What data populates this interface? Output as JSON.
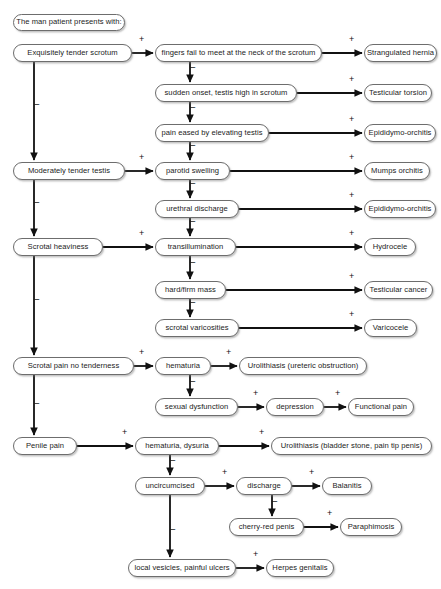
{
  "diagram": {
    "background": "#ffffff",
    "node_border": "#6d6d6d",
    "edge_color": "#111111",
    "header": {
      "label": "The man patient presents with:"
    },
    "nodes": [
      {
        "id": "header",
        "label": "The man patient presents with:",
        "x": 13,
        "y": 14,
        "w": 112,
        "h": 17
      },
      {
        "id": "l1",
        "label": "Exquisitely tender scrotum",
        "x": 13,
        "y": 44,
        "w": 119,
        "h": 18
      },
      {
        "id": "l2",
        "label": "Moderately tender testis",
        "x": 13,
        "y": 162,
        "w": 112,
        "h": 18
      },
      {
        "id": "l3",
        "label": "Scrotal heaviness",
        "x": 13,
        "y": 238,
        "w": 90,
        "h": 18
      },
      {
        "id": "l4",
        "label": "Scrotal pain no tenderness",
        "x": 13,
        "y": 357,
        "w": 121,
        "h": 18
      },
      {
        "id": "l5",
        "label": "Penile pain",
        "x": 13,
        "y": 437,
        "w": 64,
        "h": 18
      },
      {
        "id": "m1",
        "label": "fingers fail to meet at the neck of the scrotum",
        "x": 155,
        "y": 44,
        "w": 167,
        "h": 18
      },
      {
        "id": "m2",
        "label": "sudden onset, testis high in scrotum",
        "x": 155,
        "y": 84,
        "w": 142,
        "h": 18
      },
      {
        "id": "m3",
        "label": "pain eased by elevating testis",
        "x": 155,
        "y": 124,
        "w": 114,
        "h": 18
      },
      {
        "id": "m4",
        "label": "parotid swelling",
        "x": 155,
        "y": 162,
        "w": 75,
        "h": 18
      },
      {
        "id": "m5",
        "label": "urethral discharge",
        "x": 155,
        "y": 200,
        "w": 84,
        "h": 18
      },
      {
        "id": "m6",
        "label": "transillumination",
        "x": 155,
        "y": 238,
        "w": 81,
        "h": 18
      },
      {
        "id": "m7",
        "label": "hard/firm mass",
        "x": 155,
        "y": 281,
        "w": 71,
        "h": 18
      },
      {
        "id": "m8",
        "label": "scrotal varicosities",
        "x": 155,
        "y": 319,
        "w": 84,
        "h": 18
      },
      {
        "id": "m9",
        "label": "hematuria",
        "x": 155,
        "y": 357,
        "w": 56,
        "h": 18
      },
      {
        "id": "m10",
        "label": "sexual dysfunction",
        "x": 155,
        "y": 398,
        "w": 83,
        "h": 18
      },
      {
        "id": "m11",
        "label": "hematuria, dysuria",
        "x": 135,
        "y": 437,
        "w": 84,
        "h": 18
      },
      {
        "id": "m12",
        "label": "uncircumcised",
        "x": 135,
        "y": 477,
        "w": 70,
        "h": 18
      },
      {
        "id": "m13",
        "label": "discharge",
        "x": 236,
        "y": 477,
        "w": 56,
        "h": 18
      },
      {
        "id": "m14",
        "label": "cherry-red penis",
        "x": 229,
        "y": 518,
        "w": 75,
        "h": 18
      },
      {
        "id": "m15",
        "label": "local vesicles, painful ulcers",
        "x": 128,
        "y": 559,
        "w": 108,
        "h": 18
      },
      {
        "id": "r1",
        "label": "Strangulated hernia",
        "x": 364,
        "y": 44,
        "w": 73,
        "h": 18
      },
      {
        "id": "r2",
        "label": "Testicular torsion",
        "x": 364,
        "y": 84,
        "w": 68,
        "h": 18
      },
      {
        "id": "r3",
        "label": "Epididymo-orchitis",
        "x": 364,
        "y": 124,
        "w": 72,
        "h": 18
      },
      {
        "id": "r4",
        "label": "Mumps orchitis",
        "x": 364,
        "y": 162,
        "w": 66,
        "h": 18
      },
      {
        "id": "r5",
        "label": "Epididymo-orchitis",
        "x": 364,
        "y": 200,
        "w": 72,
        "h": 18
      },
      {
        "id": "r6",
        "label": "Hydrocele",
        "x": 364,
        "y": 238,
        "w": 52,
        "h": 18
      },
      {
        "id": "r7",
        "label": "Testicular cancer",
        "x": 364,
        "y": 281,
        "w": 69,
        "h": 18
      },
      {
        "id": "r8",
        "label": "Varicocele",
        "x": 364,
        "y": 319,
        "w": 53,
        "h": 18
      },
      {
        "id": "r9",
        "label": "Urolithiasis (ureteric obstruction)",
        "x": 239,
        "y": 357,
        "w": 128,
        "h": 18
      },
      {
        "id": "r10",
        "label": "depression",
        "x": 266,
        "y": 398,
        "w": 58,
        "h": 18
      },
      {
        "id": "r11",
        "label": "Functional pain",
        "x": 348,
        "y": 398,
        "w": 66,
        "h": 18
      },
      {
        "id": "r12",
        "label": "Urolithiasis (bladder stone, pain tip penis)",
        "x": 271,
        "y": 437,
        "w": 161,
        "h": 18
      },
      {
        "id": "r13",
        "label": "Balanitis",
        "x": 322,
        "y": 477,
        "w": 50,
        "h": 18
      },
      {
        "id": "r14",
        "label": "Paraphimosis",
        "x": 340,
        "y": 518,
        "w": 62,
        "h": 18
      },
      {
        "id": "r15",
        "label": "Herpes genitalis",
        "x": 266,
        "y": 559,
        "w": 68,
        "h": 18
      }
    ],
    "edges": [
      {
        "from": "l1",
        "to": "m1",
        "sign": "+",
        "kind": "h",
        "sign_x": 139,
        "sign_y": 44
      },
      {
        "from": "l1",
        "to": "l2",
        "sign": "−",
        "kind": "v",
        "sign_x": 34,
        "sign_y": 105
      },
      {
        "from": "l2",
        "to": "m4",
        "sign": "+",
        "kind": "h",
        "sign_x": 139,
        "sign_y": 162
      },
      {
        "from": "l2",
        "to": "l3",
        "sign": "−",
        "kind": "v",
        "sign_x": 34,
        "sign_y": 203
      },
      {
        "from": "l3",
        "to": "m6",
        "sign": "+",
        "kind": "h",
        "sign_x": 139,
        "sign_y": 238
      },
      {
        "from": "l3",
        "to": "l4",
        "sign": "−",
        "kind": "v",
        "sign_x": 34,
        "sign_y": 300
      },
      {
        "from": "l4",
        "to": "m9",
        "sign": "+",
        "kind": "h",
        "sign_x": 139,
        "sign_y": 357
      },
      {
        "from": "l4",
        "to": "l5",
        "sign": "−",
        "kind": "v",
        "sign_x": 34,
        "sign_y": 404
      },
      {
        "from": "l5",
        "to": "m11",
        "sign": "+",
        "kind": "h",
        "sign_x": 122,
        "sign_y": 437
      },
      {
        "from": "m1",
        "to": "r1",
        "sign": "+",
        "kind": "h",
        "sign_x": 349,
        "sign_y": 44
      },
      {
        "from": "m1",
        "to": "m2",
        "sign": "−",
        "kind": "v",
        "sign_x": 190,
        "sign_y": 68
      },
      {
        "from": "m2",
        "to": "r2",
        "sign": "+",
        "kind": "h",
        "sign_x": 349,
        "sign_y": 84
      },
      {
        "from": "m2",
        "to": "m3",
        "sign": "−",
        "kind": "v",
        "sign_x": 190,
        "sign_y": 108
      },
      {
        "from": "m3",
        "to": "r3",
        "sign": "+",
        "kind": "h",
        "sign_x": 349,
        "sign_y": 124
      },
      {
        "from": "m3",
        "to": "m4",
        "sign": "−",
        "kind": "v",
        "sign_x": 190,
        "sign_y": 146
      },
      {
        "from": "m4",
        "to": "r4",
        "sign": "+",
        "kind": "h",
        "sign_x": 349,
        "sign_y": 162
      },
      {
        "from": "m4",
        "to": "m5",
        "sign": "−",
        "kind": "v",
        "sign_x": 190,
        "sign_y": 184
      },
      {
        "from": "m5",
        "to": "r5",
        "sign": "+",
        "kind": "h",
        "sign_x": 349,
        "sign_y": 200
      },
      {
        "from": "m5",
        "to": "m6",
        "sign": "−",
        "kind": "v",
        "sign_x": 190,
        "sign_y": 222
      },
      {
        "from": "m6",
        "to": "r6",
        "sign": "+",
        "kind": "h",
        "sign_x": 349,
        "sign_y": 238
      },
      {
        "from": "m6",
        "to": "m7",
        "sign": "−",
        "kind": "v",
        "sign_x": 190,
        "sign_y": 263
      },
      {
        "from": "m7",
        "to": "r7",
        "sign": "+",
        "kind": "h",
        "sign_x": 349,
        "sign_y": 281
      },
      {
        "from": "m7",
        "to": "m8",
        "sign": "−",
        "kind": "v",
        "sign_x": 190,
        "sign_y": 303
      },
      {
        "from": "m8",
        "to": "r8",
        "sign": "+",
        "kind": "h",
        "sign_x": 349,
        "sign_y": 319
      },
      {
        "from": "m9",
        "to": "r9",
        "sign": "+",
        "kind": "h",
        "sign_x": 226,
        "sign_y": 357
      },
      {
        "from": "m9",
        "to": "m10",
        "sign": "−",
        "kind": "v",
        "sign_x": 190,
        "sign_y": 382
      },
      {
        "from": "m10",
        "to": "r10",
        "sign": "+",
        "kind": "h",
        "sign_x": 253,
        "sign_y": 398
      },
      {
        "from": "r10",
        "to": "r11",
        "sign": "+",
        "kind": "h",
        "sign_x": 335,
        "sign_y": 398
      },
      {
        "from": "m11",
        "to": "r12",
        "sign": "+",
        "kind": "h",
        "sign_x": 259,
        "sign_y": 437
      },
      {
        "from": "m11",
        "to": "m12",
        "sign": "−",
        "kind": "v",
        "sign_x": 170,
        "sign_y": 461
      },
      {
        "from": "m12",
        "to": "m13",
        "sign": "+",
        "kind": "h",
        "sign_x": 222,
        "sign_y": 477
      },
      {
        "from": "m12",
        "to": "m15",
        "sign": "−",
        "kind": "v",
        "sign_x": 170,
        "sign_y": 530
      },
      {
        "from": "m13",
        "to": "r13",
        "sign": "+",
        "kind": "h",
        "sign_x": 309,
        "sign_y": 477
      },
      {
        "from": "m13",
        "to": "m14",
        "sign": "−",
        "kind": "v",
        "sign_x": 272,
        "sign_y": 502
      },
      {
        "from": "m14",
        "to": "r14",
        "sign": "+",
        "kind": "h",
        "sign_x": 327,
        "sign_y": 518
      },
      {
        "from": "m15",
        "to": "r15",
        "sign": "+",
        "kind": "h",
        "sign_x": 253,
        "sign_y": 559
      }
    ]
  }
}
